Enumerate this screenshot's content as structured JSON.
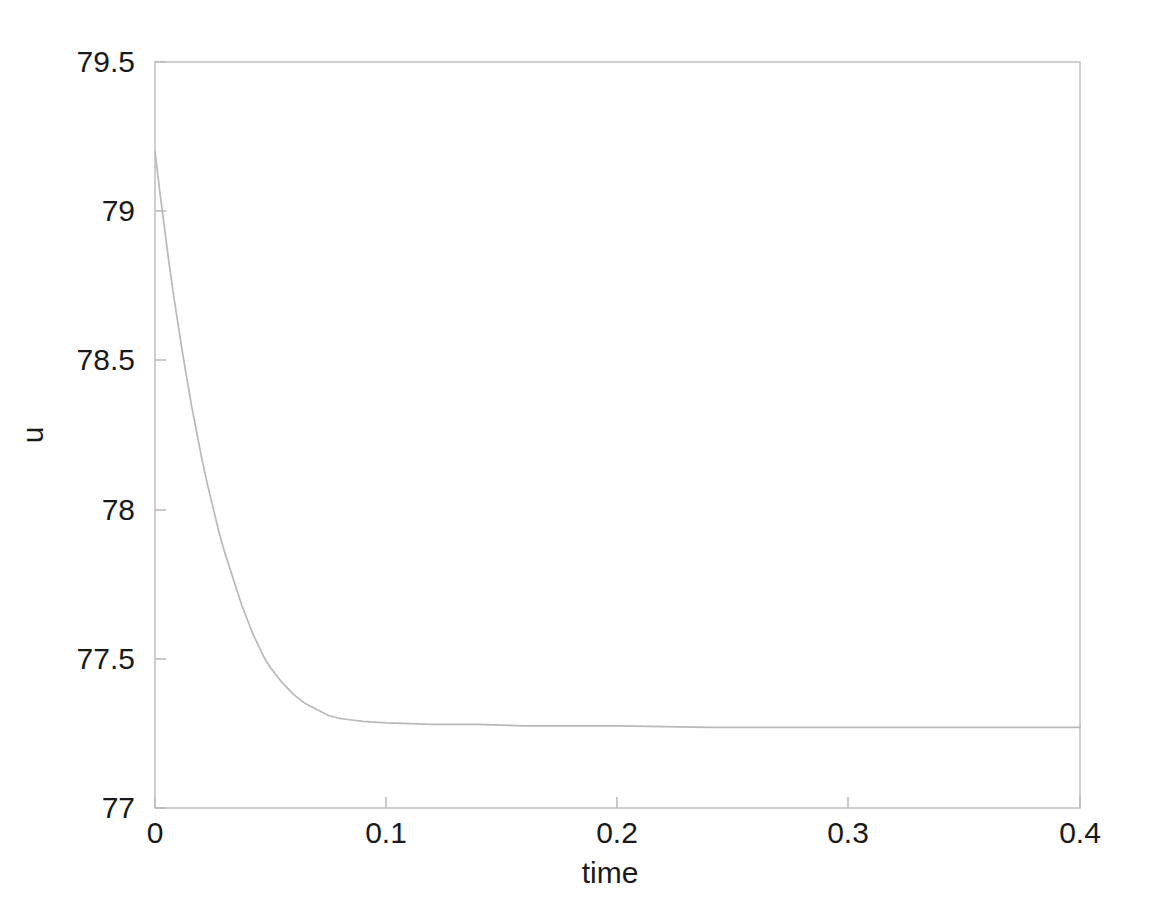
{
  "chart_data": {
    "type": "line",
    "title": "",
    "xlabel": "time",
    "ylabel": "u",
    "xlim": [
      0,
      0.4
    ],
    "ylim": [
      77,
      79.5
    ],
    "xticks": [
      "0",
      "0.1",
      "0.2",
      "0.3",
      "0.4"
    ],
    "xtick_values": [
      0,
      0.1,
      0.2,
      0.3,
      0.4
    ],
    "yticks": [
      "77",
      "77.5",
      "78",
      "78.5",
      "79",
      "79.5"
    ],
    "ytick_values": [
      77,
      77.5,
      78,
      78.5,
      79,
      79.5
    ],
    "grid": false,
    "legend": null,
    "line_color": "#b9b9b9",
    "box_color": "#c0c0c0",
    "series": [
      {
        "name": "u",
        "x": [
          0.0,
          0.002,
          0.004,
          0.006,
          0.008,
          0.01,
          0.012,
          0.014,
          0.016,
          0.018,
          0.02,
          0.0225,
          0.025,
          0.0275,
          0.03,
          0.0325,
          0.035,
          0.0375,
          0.04,
          0.0425,
          0.045,
          0.0475,
          0.05,
          0.055,
          0.06,
          0.065,
          0.07,
          0.075,
          0.08,
          0.085,
          0.09,
          0.1,
          0.12,
          0.14,
          0.16,
          0.18,
          0.2,
          0.24,
          0.28,
          0.32,
          0.36,
          0.4
        ],
        "y": [
          79.2,
          79.07,
          78.95,
          78.83,
          78.72,
          78.62,
          78.52,
          78.43,
          78.34,
          78.26,
          78.18,
          78.09,
          78.01,
          77.93,
          77.86,
          77.8,
          77.74,
          77.68,
          77.63,
          77.58,
          77.54,
          77.5,
          77.47,
          77.42,
          77.38,
          77.35,
          77.33,
          77.31,
          77.3,
          77.295,
          77.29,
          77.285,
          77.28,
          77.28,
          77.275,
          77.275,
          77.275,
          77.27,
          77.27,
          77.27,
          77.27,
          77.27
        ]
      }
    ],
    "asymptote": 77.27,
    "initial_value": 79.2
  },
  "axes": {
    "y_tick_labels": [
      {
        "text": "79.5",
        "value": 79.5
      },
      {
        "text": "79",
        "value": 79
      },
      {
        "text": "78.5",
        "value": 78.5
      },
      {
        "text": "78",
        "value": 78
      },
      {
        "text": "77.5",
        "value": 77.5
      },
      {
        "text": "77",
        "value": 77
      }
    ],
    "x_tick_labels": [
      {
        "text": "0",
        "value": 0
      },
      {
        "text": "0.1",
        "value": 0.1
      },
      {
        "text": "0.2",
        "value": 0.2
      },
      {
        "text": "0.3",
        "value": 0.3
      },
      {
        "text": "0.4",
        "value": 0.4
      }
    ],
    "xlabel": "time",
    "ylabel": "u"
  }
}
